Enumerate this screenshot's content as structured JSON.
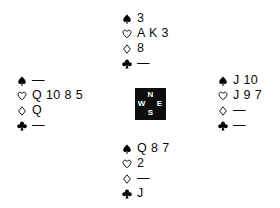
{
  "diagram": {
    "type": "bridge-hand-diagram",
    "background_color": "#ffffff",
    "ink_color": "#000000"
  },
  "suits": {
    "spade": {
      "name": "spade-icon",
      "glyph": "♠",
      "fill": "solid"
    },
    "heart": {
      "name": "heart-icon",
      "glyph": "♡",
      "fill": "outline"
    },
    "diamond": {
      "name": "diamond-icon",
      "glyph": "♢",
      "fill": "outline"
    },
    "club": {
      "name": "club-icon",
      "glyph": "♣",
      "fill": "solid"
    }
  },
  "void_marker": "—",
  "compass": {
    "background_color": "#0d0d0d",
    "text_color": "#ffffff",
    "north": "N",
    "west": "W",
    "east": "E",
    "south": "S"
  },
  "hands": {
    "north": {
      "label": "North",
      "spades": "3",
      "hearts": "A K 3",
      "diamonds": "8",
      "clubs": "—"
    },
    "west": {
      "label": "West",
      "spades": "—",
      "hearts": "Q 10 8 5",
      "diamonds": "Q",
      "clubs": "—"
    },
    "east": {
      "label": "East",
      "spades": "J 10",
      "hearts": "J 9 7",
      "diamonds": "—",
      "clubs": "—"
    },
    "south": {
      "label": "South",
      "spades": "Q 8 7",
      "hearts": "2",
      "diamonds": "—",
      "clubs": "J"
    }
  }
}
